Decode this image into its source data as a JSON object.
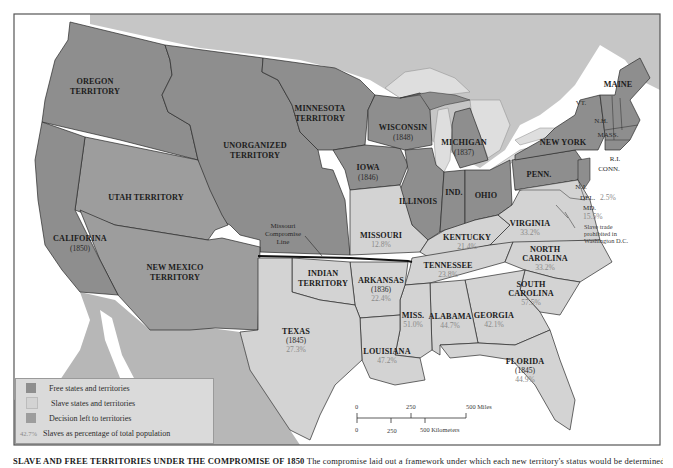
{
  "colors": {
    "free": "#8e8e8e",
    "slave": "#d3d3d3",
    "decision": "#9d9d9d",
    "foreign": "#c6c6c6",
    "mexico": "#b7b7b7",
    "lakes": "#dedede",
    "water": "#ffffff",
    "border": "#2a2a2a",
    "percent_text": "#8a8a8a"
  },
  "territories": {
    "oregon": {
      "line1": "OREGON",
      "line2": "TERRITORY"
    },
    "unorganized": {
      "line1": "UNORGANIZED",
      "line2": "TERRITORY"
    },
    "minnesota": {
      "line1": "MINNESOTA",
      "line2": "TERRITORY"
    },
    "utah": {
      "line1": "UTAH TERRITORY"
    },
    "new_mexico": {
      "line1": "NEW MEXICO",
      "line2": "TERRITORY"
    },
    "indian": {
      "line1": "INDIAN",
      "line2": "TERRITORY"
    }
  },
  "states": {
    "california": {
      "name": "CALIFORINA",
      "year": "(1850)"
    },
    "wisconsin": {
      "name": "WISCONSIN",
      "year": "(1848)"
    },
    "michigan": {
      "name": "MICHIGAN",
      "year": "(1837)"
    },
    "iowa": {
      "name": "IOWA",
      "year": "(1846)"
    },
    "illinois": {
      "name": "ILLINOIS"
    },
    "indiana": {
      "name": "IND."
    },
    "ohio": {
      "name": "OHIO"
    },
    "penn": {
      "name": "PENN."
    },
    "new_york": {
      "name": "NEW YORK"
    },
    "maine": {
      "name": "MAINE"
    },
    "vermont": {
      "name": "VT."
    },
    "new_hampshire": {
      "name": "N.H."
    },
    "mass": {
      "name": "MASS."
    },
    "ri": {
      "name": "R.I."
    },
    "conn": {
      "name": "CONN."
    },
    "nj": {
      "name": "N.J."
    },
    "delaware": {
      "name": "DEL.",
      "pct": "2.5%"
    },
    "maryland": {
      "name": "MD.",
      "pct": "15.5%"
    },
    "missouri": {
      "name": "MISSOURI",
      "pct": "12.8%"
    },
    "kentucky": {
      "name": "KENTUCKY",
      "pct": "21.4%"
    },
    "virginia": {
      "name": "VIRGINIA",
      "pct": "33.2%"
    },
    "tennessee": {
      "name": "TENNESSEE",
      "pct": "23.8%"
    },
    "north_carolina": {
      "line1": "NORTH",
      "line2": "CAROLINA",
      "pct": "33.2%"
    },
    "south_carolina": {
      "line1": "SOUTH",
      "line2": "CAROLINA",
      "pct": "57.5%"
    },
    "arkansas": {
      "name": "ARKANSAS",
      "year": "(1836)",
      "pct": "22.4%"
    },
    "texas": {
      "name": "TEXAS",
      "year": "(1845)",
      "pct": "27.3%"
    },
    "mississippi": {
      "name": "MISS.",
      "pct": "51.0%"
    },
    "alabama": {
      "name": "ALABAMA",
      "pct": "44.7%"
    },
    "georgia": {
      "name": "GEORGIA",
      "pct": "42.1%"
    },
    "louisiana": {
      "name": "LOUISIANA",
      "pct": "47.2%"
    },
    "florida": {
      "name": "FLORIDA",
      "year": "(1845)",
      "pct": "44.9%"
    }
  },
  "annotations": {
    "missouri_line": {
      "line1": "Missouri",
      "line2": "Compromise",
      "line3": "Line"
    },
    "dc_note": {
      "line1": "Slave trade",
      "line2": "prohibited in",
      "line3": "Washington D.C."
    }
  },
  "legend": {
    "items": [
      {
        "label": "Free states and territories",
        "key": "free"
      },
      {
        "label": "Slave states and territories",
        "key": "slave"
      },
      {
        "label": "Decision left to territories",
        "key": "decision"
      },
      {
        "label": "Slaves as percentage of total population",
        "sample": "42.7%"
      }
    ]
  },
  "scale": {
    "miles_ticks": [
      "0",
      "250",
      "500 Miles"
    ],
    "km_ticks": [
      "0",
      "250",
      "500 Kilometers"
    ]
  },
  "caption": {
    "title": "SLAVE AND FREE TERRITORIES UNDER THE COMPROMISE OF 1850",
    "text": " The compromise laid out a framework under which each new territory's status would be determined..."
  }
}
